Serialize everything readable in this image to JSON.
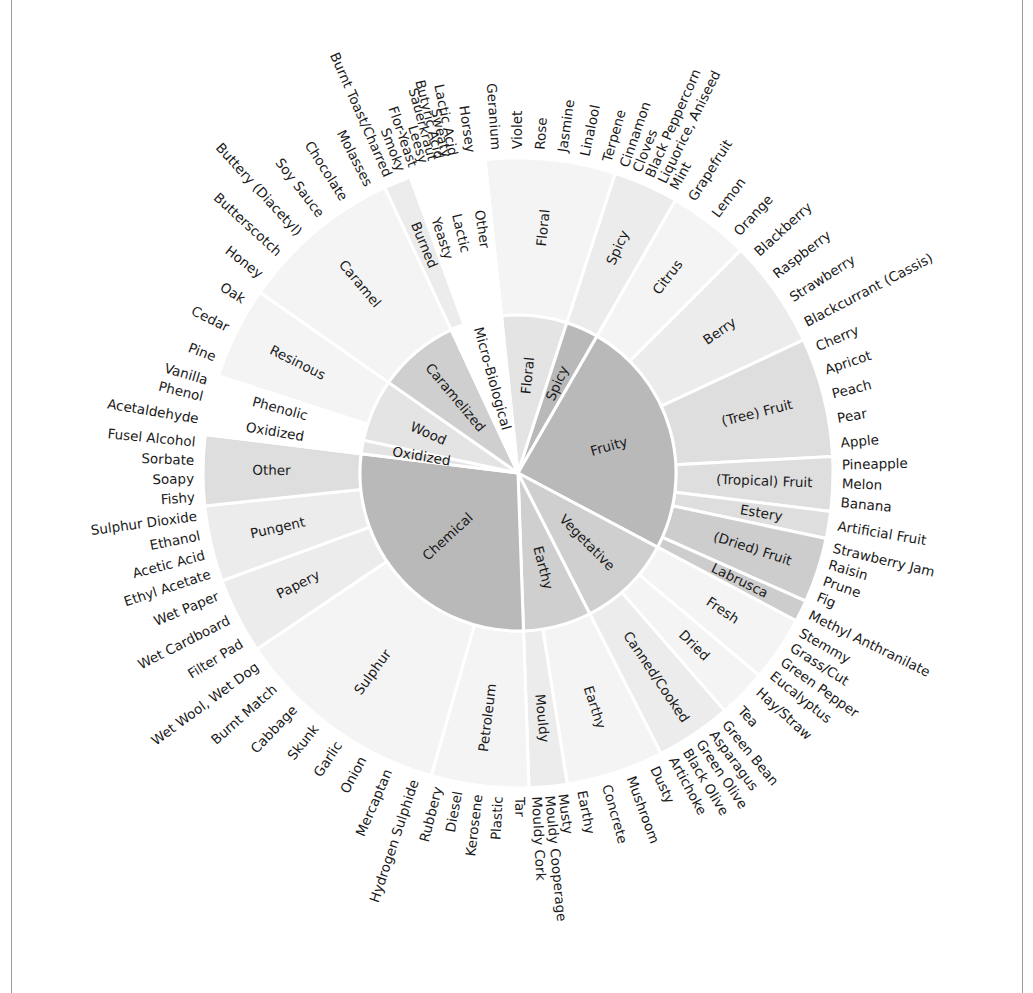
{
  "colors": {
    "background": "#ffffff",
    "inner_dark": "#b9b9b9",
    "inner_mid": "#cfcfcf",
    "inner_light": "#e4e4e4",
    "mid_dark": "#cdcdcd",
    "mid_mid": "#dedede",
    "mid_light": "#ececec",
    "mid_faint": "#f4f4f4",
    "separator": "#ffffff",
    "text": "#1a1a1a"
  },
  "chart_data": {
    "type": "sunburst",
    "title": "",
    "center": [
      518,
      473
    ],
    "radii": {
      "inner": 158,
      "middle": 315,
      "labels": 324
    },
    "levels": [
      "category",
      "subcategory",
      "descriptor"
    ],
    "categories": [
      {
        "name": "Floral",
        "start": 354,
        "end": 18,
        "shade": "inner_light",
        "subcategories": [
          {
            "name": "Floral",
            "start": 354,
            "end": 18,
            "shade": "mid_faint",
            "descriptors": [
              "Geranium",
              "Violet",
              "Rose",
              "Jasmine",
              "Linalool",
              "Terpene"
            ]
          }
        ]
      },
      {
        "name": "Spicy",
        "start": 18,
        "end": 30,
        "shade": "inner_dark",
        "subcategories": [
          {
            "name": "Spicy",
            "start": 18,
            "end": 30,
            "shade": "mid_light",
            "descriptors": [
              "Cinnamon",
              "Cloves",
              "Black Peppercorn",
              "Liquorice, Aniseed",
              "Mint"
            ]
          }
        ]
      },
      {
        "name": "Fruity",
        "start": 30,
        "end": 118,
        "shade": "inner_dark",
        "subcategories": [
          {
            "name": "Citrus",
            "start": 30,
            "end": 45,
            "shade": "mid_faint",
            "descriptors": [
              "Grapefruit",
              "Lemon",
              "Orange"
            ]
          },
          {
            "name": "Berry",
            "start": 45,
            "end": 65,
            "shade": "mid_light",
            "descriptors": [
              "Blackberry",
              "Raspberry",
              "Strawberry",
              "Blackcurrant (Cassis)"
            ]
          },
          {
            "name": "(Tree) Fruit",
            "start": 65,
            "end": 87,
            "shade": "mid_mid",
            "descriptors": [
              "Cherry",
              "Apricot",
              "Peach",
              "Pear",
              "Apple"
            ]
          },
          {
            "name": "(Tropical) Fruit",
            "start": 87,
            "end": 97,
            "shade": "mid_mid",
            "descriptors": [
              "Pineapple",
              "Melon",
              "Banana"
            ]
          },
          {
            "name": "Estery",
            "start": 97,
            "end": 102,
            "shade": "mid_mid",
            "descriptors": [
              "Artificial Fruit"
            ]
          },
          {
            "name": "(Dried) Fruit",
            "start": 102,
            "end": 114,
            "shade": "mid_dark",
            "descriptors": [
              "Strawberry Jam",
              "Raisin",
              "Prune",
              "Fig"
            ]
          },
          {
            "name": "Labrusca",
            "start": 114,
            "end": 118,
            "shade": "mid_dark",
            "descriptors": [
              "Methyl Anthranilate"
            ]
          }
        ]
      },
      {
        "name": "Vegetative",
        "start": 118,
        "end": 153,
        "shade": "inner_mid",
        "subcategories": [
          {
            "name": "Fresh",
            "start": 118,
            "end": 130,
            "shade": "mid_faint",
            "descriptors": [
              "Stemmy",
              "Grass/Cut",
              "Green Pepper",
              "Eucalyptus"
            ]
          },
          {
            "name": "Dried",
            "start": 130,
            "end": 139,
            "shade": "mid_faint",
            "descriptors": [
              "Hay/Straw",
              "Tea"
            ]
          },
          {
            "name": "Canned/Cooked",
            "start": 139,
            "end": 153,
            "shade": "mid_light",
            "descriptors": [
              "Green Bean",
              "Asparagus",
              "Green Olive",
              "Black Olive",
              "Artichoke"
            ]
          }
        ]
      },
      {
        "name": "Earthy",
        "start": 153,
        "end": 178,
        "shade": "inner_mid",
        "subcategories": [
          {
            "name": "Earthy",
            "start": 153,
            "end": 171,
            "shade": "mid_faint",
            "descriptors": [
              "Dusty",
              "Mushroom",
              "Concrete",
              "Earthy"
            ]
          },
          {
            "name": "Mouldy",
            "start": 171,
            "end": 178,
            "shade": "mid_light",
            "descriptors": [
              "Musty",
              "Mouldy Cooperage",
              "Mouldy Cork"
            ]
          }
        ]
      },
      {
        "name": "Chemical",
        "start": 178,
        "end": 277,
        "shade": "inner_dark",
        "subcategories": [
          {
            "name": "Petroleum",
            "start": 178,
            "end": 196,
            "shade": "mid_faint",
            "descriptors": [
              "Tar",
              "Plastic",
              "Kerosene",
              "Diesel",
              "Rubbery"
            ]
          },
          {
            "name": "Sulphur",
            "start": 196,
            "end": 236,
            "shade": "mid_faint",
            "descriptors": [
              "Hydrogen Sulphide",
              "Mercaptan",
              "Onion",
              "Garlic",
              "Skunk",
              "Cabbage",
              "Burnt Match",
              "Wet Wool, Wet Dog"
            ]
          },
          {
            "name": "Papery",
            "start": 236,
            "end": 250,
            "shade": "mid_light",
            "descriptors": [
              "Filter Pad",
              "Wet Cardboard",
              "Wet Paper"
            ]
          },
          {
            "name": "Pungent",
            "start": 250,
            "end": 264,
            "shade": "mid_light",
            "descriptors": [
              "Ethyl Acetate",
              "Acetic Acid",
              "Ethanol",
              "Sulphur Dioxide"
            ]
          },
          {
            "name": "Other",
            "start": 264,
            "end": 277,
            "shade": "mid_mid",
            "descriptors": [
              "Fishy",
              "Soapy",
              "Sorbate",
              "Fusel Alcohol"
            ]
          }
        ]
      },
      {
        "name": "Oxidized",
        "start": 277,
        "end": 282,
        "shade": "inner_light",
        "subcategories": [
          {
            "name": "Oxidized",
            "start": 277,
            "end": 282,
            "shade": "none",
            "descriptors": [
              "Acetaldehyde"
            ]
          }
        ]
      },
      {
        "name": "Wood",
        "start": 282,
        "end": 305,
        "shade": "inner_light",
        "subcategories": [
          {
            "name": "Phenolic",
            "start": 282,
            "end": 288,
            "shade": "none",
            "descriptors": [
              "Phenol",
              "Vanilla"
            ]
          },
          {
            "name": "Resinous",
            "start": 288,
            "end": 305,
            "shade": "mid_faint",
            "descriptors": [
              "Pine",
              "Cedar",
              "Oak"
            ]
          }
        ]
      },
      {
        "name": "Caramelized",
        "start": 305,
        "end": 335,
        "shade": "inner_mid",
        "subcategories": [
          {
            "name": "Caramel",
            "start": 305,
            "end": 335,
            "shade": "mid_faint",
            "descriptors": [
              "Honey",
              "Butterscotch",
              "Buttery (Diacetyl)",
              "Soy Sauce",
              "Chocolate",
              "Molasses"
            ]
          }
        ]
      },
      {
        "name": "Micro-Biological",
        "start": 335,
        "end": 354,
        "shade": "none",
        "subcategories": [
          {
            "name": "Burned",
            "start": 335,
            "end": 340,
            "shade": "mid_light",
            "descriptors": [
              "Burnt Toast/Charred",
              "Smoky"
            ]
          },
          {
            "name": "Yeasty",
            "start": 340,
            "end": 344,
            "shade": "none",
            "descriptors": [
              "Flor-Yeast",
              "Leesy"
            ]
          },
          {
            "name": "Lactic",
            "start": 344,
            "end": 349,
            "shade": "none",
            "descriptors": [
              "Sauerkraut",
              "Butyric Acid",
              "Sweaty",
              "Lactic Acid"
            ]
          },
          {
            "name": "Other",
            "start": 349,
            "end": 354,
            "shade": "none",
            "descriptors": [
              "Horsey"
            ]
          }
        ]
      }
    ]
  }
}
